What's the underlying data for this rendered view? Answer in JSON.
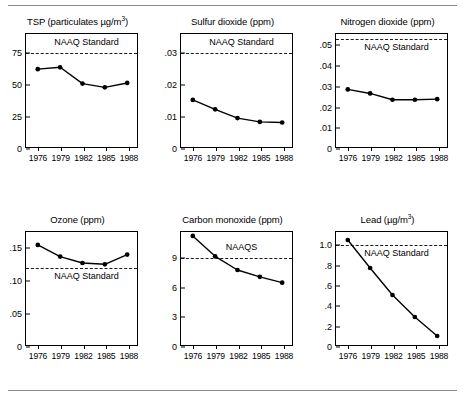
{
  "figure": {
    "rule_color": "#8c8c8c",
    "line_color": "#000000"
  },
  "chart_data": [
    {
      "type": "line",
      "title": "TSP (particulates µg/m",
      "title_sup": "3",
      "title_suffix": ")",
      "pollutant": "TSP",
      "units": "µg/m3",
      "categories": [
        "1976",
        "1979",
        "1982",
        "1985",
        "1988"
      ],
      "x": [
        1976,
        1979,
        1982,
        1985,
        1988
      ],
      "values": [
        62,
        63.5,
        50.5,
        47.5,
        51
      ],
      "xlabel": "",
      "ylabel": "",
      "ylim": [
        0,
        90
      ],
      "yticks": [
        0,
        25,
        50,
        75
      ],
      "ytick_labels": [
        "0",
        "25",
        "50",
        "75"
      ],
      "grid": false,
      "annotations": [
        {
          "label": "NAAQ Standard",
          "value": 75,
          "style": "dashed",
          "label_position": "above"
        }
      ]
    },
    {
      "type": "line",
      "title": "Sulfur dioxide (ppm)",
      "pollutant": "Sulfur dioxide",
      "units": "ppm",
      "categories": [
        "1976",
        "1979",
        "1982",
        "1985",
        "1988"
      ],
      "x": [
        1976,
        1979,
        1982,
        1985,
        1988
      ],
      "values": [
        0.015,
        0.012,
        0.0092,
        0.008,
        0.0078
      ],
      "xlabel": "",
      "ylabel": "",
      "ylim": [
        0,
        0.036
      ],
      "yticks": [
        0,
        0.01,
        0.02,
        0.03
      ],
      "ytick_labels": [
        "0",
        ".01",
        ".02",
        ".03"
      ],
      "grid": false,
      "annotations": [
        {
          "label": "NAAQ Standard",
          "value": 0.03,
          "style": "dashed",
          "label_position": "above"
        }
      ]
    },
    {
      "type": "line",
      "title": "Nitrogen dioxide (ppm)",
      "pollutant": "Nitrogen dioxide",
      "units": "ppm",
      "categories": [
        "1976",
        "1979",
        "1982",
        "1985",
        "1988"
      ],
      "x": [
        1976,
        1979,
        1982,
        1985,
        1988
      ],
      "values": [
        0.0283,
        0.0263,
        0.0232,
        0.0232,
        0.0235
      ],
      "xlabel": "",
      "ylabel": "",
      "ylim": [
        0,
        0.0555
      ],
      "yticks": [
        0,
        0.01,
        0.02,
        0.03,
        0.04,
        0.05
      ],
      "ytick_labels": [
        "0",
        ".01",
        ".02",
        ".03",
        ".04",
        ".05"
      ],
      "grid": false,
      "annotations": [
        {
          "label": "NAAQ Standard",
          "value": 0.053,
          "style": "dashed",
          "label_position": "below"
        }
      ]
    },
    {
      "type": "line",
      "title": "Ozone (ppm)",
      "pollutant": "Ozone",
      "units": "ppm",
      "categories": [
        "1976",
        "1979",
        "1982",
        "1985",
        "1988"
      ],
      "x": [
        1976,
        1979,
        1982,
        1985,
        1988
      ],
      "values": [
        0.155,
        0.137,
        0.127,
        0.125,
        0.14
      ],
      "xlabel": "",
      "ylabel": "",
      "ylim": [
        0,
        0.175
      ],
      "yticks": [
        0,
        0.05,
        0.1,
        0.15
      ],
      "ytick_labels": [
        "0",
        ".05",
        ".10",
        ".15"
      ],
      "grid": false,
      "annotations": [
        {
          "label": "NAAQ Standard",
          "value": 0.12,
          "style": "dashed",
          "label_position": "below"
        }
      ]
    },
    {
      "type": "line",
      "title": "Carbon monoxide (ppm)",
      "pollutant": "Carbon monoxide",
      "units": "ppm",
      "categories": [
        "1976",
        "1979",
        "1982",
        "1985",
        "1988"
      ],
      "x": [
        1976,
        1979,
        1982,
        1985,
        1988
      ],
      "values": [
        11.2,
        9.1,
        7.7,
        7.0,
        6.4
      ],
      "xlabel": "",
      "ylabel": "",
      "ylim": [
        0,
        11.6
      ],
      "yticks": [
        0,
        3,
        6,
        9
      ],
      "ytick_labels": [
        "0",
        "3",
        "6",
        "9"
      ],
      "grid": false,
      "annotations": [
        {
          "label": "NAAQS",
          "value": 9,
          "style": "dashed",
          "label_position": "above"
        }
      ]
    },
    {
      "type": "line",
      "title": "Lead (µg/m",
      "title_sup": "3",
      "title_suffix": ")",
      "pollutant": "Lead",
      "units": "µg/m3",
      "categories": [
        "1976",
        "1979",
        "1982",
        "1985",
        "1988"
      ],
      "x": [
        1976,
        1979,
        1982,
        1985,
        1988
      ],
      "values": [
        1.05,
        0.77,
        0.5,
        0.28,
        0.09
      ],
      "xlabel": "",
      "ylabel": "",
      "ylim": [
        0,
        1.13
      ],
      "yticks": [
        0,
        0.2,
        0.4,
        0.6,
        0.8,
        1.0
      ],
      "ytick_labels": [
        "0",
        ".2",
        ".4",
        ".6",
        ".8",
        "1.0"
      ],
      "grid": false,
      "annotations": [
        {
          "label": "NAAQ Standard",
          "value": 1.0,
          "style": "dashed",
          "label_position": "below"
        }
      ]
    }
  ]
}
